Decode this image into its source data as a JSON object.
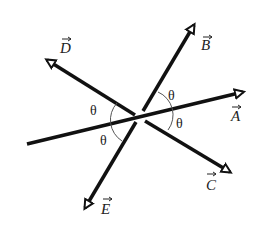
{
  "diagram": {
    "title": "",
    "vectors": [
      {
        "name": "A",
        "label": "A",
        "from": [
          27,
          144
        ],
        "to": [
          248,
          91
        ]
      },
      {
        "name": "B",
        "label": "B",
        "from": [
          143,
          111
        ],
        "to": [
          197,
          20
        ]
      },
      {
        "name": "C",
        "label": "C",
        "from": [
          145,
          120
        ],
        "to": [
          234,
          175
        ]
      },
      {
        "name": "D",
        "label": "D",
        "from": [
          135,
          115
        ],
        "to": [
          43,
          57
        ]
      },
      {
        "name": "E",
        "label": "E",
        "from": [
          136,
          122
        ],
        "to": [
          82,
          213
        ]
      }
    ],
    "angle_symbol": "θ",
    "angles": [
      {
        "label": "θ",
        "position": "upper-right"
      },
      {
        "label": "θ",
        "position": "lower-right"
      },
      {
        "label": "θ",
        "position": "upper-left"
      },
      {
        "label": "θ",
        "position": "lower-left"
      }
    ],
    "labels": {
      "A": "A",
      "B": "B",
      "C": "C",
      "D": "D",
      "E": "E"
    },
    "colors": {
      "line": "#111111",
      "arc": "#555555",
      "background": "#ffffff"
    }
  }
}
